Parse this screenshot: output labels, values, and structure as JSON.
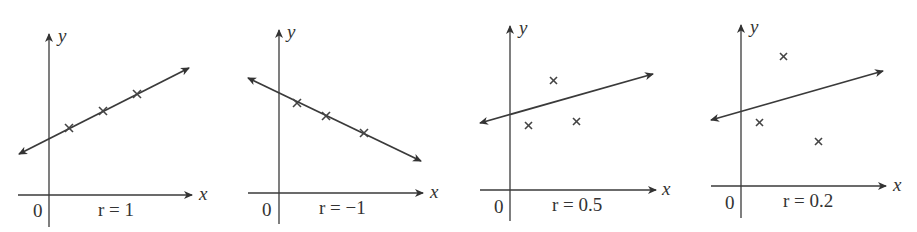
{
  "figure": {
    "panels": [
      {
        "r_label": "r = 1",
        "origin_label": "0",
        "x_axis_label": "x",
        "y_axis_label": "y",
        "r_value": 1,
        "points": [
          [
            1,
            1
          ],
          [
            2,
            1.5
          ],
          [
            3,
            2
          ]
        ],
        "line": {
          "slope": 0.5,
          "intercept": 0.5
        }
      },
      {
        "r_label": "r = −1",
        "origin_label": "0",
        "x_axis_label": "x",
        "y_axis_label": "y",
        "r_value": -1,
        "points": [
          [
            1,
            3.5
          ],
          [
            2,
            3.05
          ],
          [
            3,
            2.5
          ]
        ],
        "line": {
          "slope": -0.5,
          "intercept": 4.0
        }
      },
      {
        "r_label": "r = 0.5",
        "origin_label": "0",
        "x_axis_label": "x",
        "y_axis_label": "y",
        "r_value": 0.5,
        "points": [
          [
            1,
            2.2
          ],
          [
            2,
            3.7
          ],
          [
            3,
            2.3
          ]
        ],
        "line": {
          "slope": 0.45,
          "intercept": 2.4
        }
      },
      {
        "r_label": "r = 0.2",
        "origin_label": "0",
        "x_axis_label": "x",
        "y_axis_label": "y",
        "r_value": 0.2,
        "points": [
          [
            1,
            2.1
          ],
          [
            2,
            4.3
          ],
          [
            3.2,
            1.5
          ]
        ],
        "line": {
          "slope": 0.45,
          "intercept": 2.25
        }
      }
    ]
  }
}
